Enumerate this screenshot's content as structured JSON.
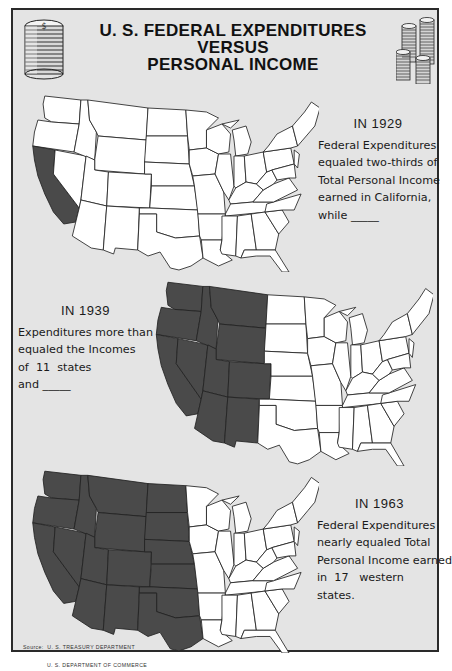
{
  "poster": {
    "title_line1": "U. S. FEDERAL EXPENDITURES VERSUS",
    "title_line2": "PERSONAL INCOME",
    "left_icon": "coin-stack-icon",
    "right_icon": "coin-stacks-icon",
    "colors": {
      "background": "#e4e4e4",
      "state_fill": "#ffffff",
      "state_highlight": "#4a4a4a",
      "border": "#2a2a2a"
    }
  },
  "panels": [
    {
      "year_label": "IN 1929",
      "lines": [
        "Federal Expenditures",
        "equaled two-thirds of",
        "Total Personal Income",
        "earned in California,",
        "while _____"
      ],
      "highlighted_states": [
        "CA"
      ]
    },
    {
      "year_label": "IN 1939",
      "lines": [
        "Expenditures more than",
        "equaled the Incomes",
        "of  11  states",
        "and _____"
      ],
      "highlighted_states": [
        "WA",
        "OR",
        "CA",
        "ID",
        "NV",
        "MT",
        "WY",
        "UT",
        "CO",
        "AZ",
        "NM"
      ]
    },
    {
      "year_label": "IN 1963",
      "lines": [
        "Federal Expenditures",
        "nearly equaled Total",
        "Personal Income earned",
        "in  17   western",
        "states."
      ],
      "highlighted_states": [
        "WA",
        "OR",
        "CA",
        "ID",
        "NV",
        "MT",
        "WY",
        "UT",
        "CO",
        "AZ",
        "NM",
        "ND",
        "SD",
        "NE",
        "KS",
        "OK",
        "TX"
      ]
    }
  ],
  "source": {
    "line1": "Source:  U. S. TREASURY DEPARTMENT",
    "line2": "             U. S. DEPARTMENT OF COMMERCE"
  }
}
